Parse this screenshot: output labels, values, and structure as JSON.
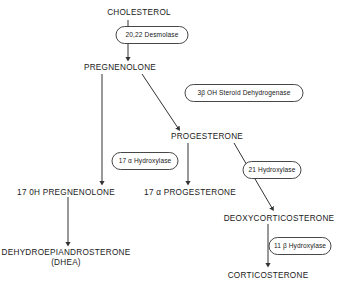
{
  "diagram": {
    "type": "flowchart",
    "line_color": "#333333",
    "text_color": "#1a1a1a",
    "background": "#ffffff",
    "nodes": [
      {
        "id": "cholesterol",
        "label": "CHOLESTEROL",
        "x": 139,
        "y": 8
      },
      {
        "id": "pregnenolone",
        "label": "PREGNENOLONE",
        "x": 120,
        "y": 63
      },
      {
        "id": "progesterone",
        "label": "PROGESTERONE",
        "x": 207,
        "y": 132
      },
      {
        "id": "17oh_pregnenolone",
        "label": "17 0H PREGNENOLONE",
        "x": 66,
        "y": 188
      },
      {
        "id": "17a_progesterone",
        "label": "17 α PROGESTERONE",
        "x": 190,
        "y": 188
      },
      {
        "id": "deoxycorticosterone",
        "label": "DEOXYCORTICOSTERONE",
        "x": 279,
        "y": 214
      },
      {
        "id": "dhea",
        "label": "DEHYDROEPIANDROSTERONE",
        "x": 66,
        "y": 248
      },
      {
        "id": "dhea_abbrev",
        "label": "(DHEA)",
        "x": 66,
        "y": 258
      },
      {
        "id": "corticosterone",
        "label": "CORTICOSTERONE",
        "x": 268,
        "y": 271
      }
    ],
    "enzymes": [
      {
        "id": "desmolase",
        "label": "20,22 Desmolase",
        "x": 152,
        "y": 35,
        "w": 72,
        "h": 17
      },
      {
        "id": "hsd3b",
        "label": "3β OH Steroid Dehydrogenase",
        "x": 244,
        "y": 93,
        "w": 118,
        "h": 17
      },
      {
        "id": "hydroxylase17a",
        "label": "17 α Hydroxylase",
        "x": 145,
        "y": 161,
        "w": 66,
        "h": 17
      },
      {
        "id": "hydroxylase21",
        "label": "21 Hydroxylase",
        "x": 272,
        "y": 170,
        "w": 58,
        "h": 17
      },
      {
        "id": "hydroxylase11b",
        "label": "11 β Hydroxylase",
        "x": 300,
        "y": 246,
        "w": 62,
        "h": 17
      }
    ],
    "arrows": [
      {
        "id": "cholesterol-to-pregnenolone",
        "x1": 128,
        "y1": 20,
        "x2": 128,
        "y2": 58
      },
      {
        "id": "pregnenolone-to-progesterone",
        "x1": 142,
        "y1": 74,
        "x2": 178,
        "y2": 128
      },
      {
        "id": "pregnenolone-to-17oh-pregnenolone",
        "x1": 102,
        "y1": 74,
        "x2": 102,
        "y2": 182
      },
      {
        "id": "progesterone-to-17a-progesterone",
        "x1": 188,
        "y1": 143,
        "x2": 188,
        "y2": 182
      },
      {
        "id": "progesterone-to-deoxycorticosterone",
        "x1": 234,
        "y1": 143,
        "x2": 272,
        "y2": 208
      },
      {
        "id": "17oh-pregnenolone-to-dhea",
        "x1": 68,
        "y1": 197,
        "x2": 68,
        "y2": 243
      },
      {
        "id": "deoxycorticosterone-to-corticosterone",
        "x1": 268,
        "y1": 224,
        "x2": 268,
        "y2": 264
      }
    ]
  }
}
